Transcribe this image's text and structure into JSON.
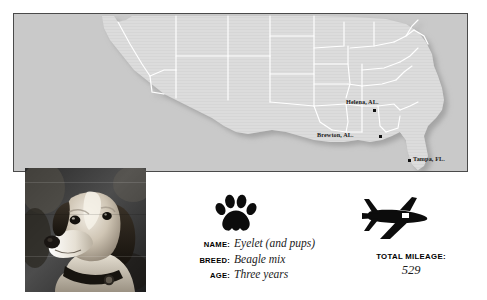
{
  "map": {
    "name": "United States map",
    "background_color": "#c9c9c9",
    "land_color": "#dcdcdc",
    "border_color": "#ffffff",
    "frame_color": "#4a4a4a",
    "cities": [
      {
        "label": "Helena, AL.",
        "x": 347,
        "y": 95,
        "dot_x": 360,
        "dot_y": 96,
        "label_position": "above"
      },
      {
        "label": "Brewton, AL.",
        "x": 318,
        "y": 118,
        "dot_x": 366,
        "dot_y": 122,
        "label_position": "left"
      },
      {
        "label": "Tampa, FL.",
        "x": 414,
        "y": 144,
        "dot_x": 409,
        "dot_y": 146,
        "label_position": "right"
      }
    ]
  },
  "photo": {
    "alt": "Black and white photograph of a beagle mix dog wearing a collar with a tag"
  },
  "icons": {
    "paw": "paw-print-icon",
    "plane": "airplane-icon"
  },
  "details": {
    "fields": [
      {
        "label": "NAME:",
        "value": "Eyelet (and pups)"
      },
      {
        "label": "BREED:",
        "value": "Beagle mix"
      },
      {
        "label": "AGE:",
        "value": "Three years"
      }
    ]
  },
  "mileage": {
    "label": "TOTAL MILEAGE:",
    "value": "529"
  }
}
